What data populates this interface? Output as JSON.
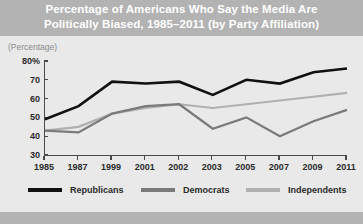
{
  "figure": {
    "title_line1": "Percentage of Americans Who Say the Media Are",
    "title_line2": "Politically Biased, 1985–2011 (by Party Affiliation)",
    "axis_note": "(Percentage)"
  },
  "colors": {
    "title_band": "#b3b3b3",
    "plot_background": "#e9e9e9",
    "bottom_bar": "#b3b3b3",
    "axis": "#4a4a4a",
    "republicans": "#111111",
    "democrats": "#7a7a7a",
    "independents": "#b0b0b0",
    "title_text": "#ffffff",
    "tick_text": "#2b2b2b",
    "note_text": "#8c8c8c"
  },
  "chart_data": {
    "type": "line",
    "title": "Percentage of Americans Who Say the Media Are Politically Biased, 1985–2011 (by Party Affiliation)",
    "xlabel": "",
    "ylabel": "(Percentage)",
    "categories": [
      "1985",
      "1987",
      "1999",
      "2001",
      "2002",
      "2003",
      "2005",
      "2007",
      "2009",
      "2011"
    ],
    "ylim": [
      30,
      80
    ],
    "yticks": [
      30,
      40,
      50,
      60,
      70,
      80
    ],
    "ytick_labels": [
      "30",
      "40",
      "50",
      "60",
      "70",
      "80%"
    ],
    "grid": false,
    "legend_position": "bottom",
    "series": [
      {
        "name": "Republicans",
        "color": "#111111",
        "values": [
          49,
          56,
          69,
          68,
          69,
          62,
          70,
          68,
          74,
          76
        ]
      },
      {
        "name": "Democrats",
        "color": "#7a7a7a",
        "values": [
          43,
          42,
          52,
          56,
          57,
          44,
          50,
          40,
          48,
          54
        ]
      },
      {
        "name": "Independents",
        "color": "#b0b0b0",
        "values": [
          43,
          45,
          52,
          55,
          57,
          55,
          57,
          59,
          61,
          63
        ]
      }
    ]
  },
  "legend": [
    {
      "label": "Republicans",
      "color": "#111111"
    },
    {
      "label": "Democrats",
      "color": "#7a7a7a"
    },
    {
      "label": "Independents",
      "color": "#b0b0b0"
    }
  ]
}
